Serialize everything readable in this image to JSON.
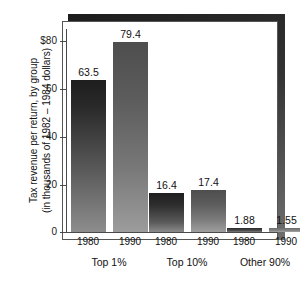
{
  "chart_data": {
    "type": "bar",
    "title": "",
    "xlabel": "",
    "ylabel_lines": [
      "Tax revenue per return, by group",
      "(in thousands of 1982 – 1984 dollars)"
    ],
    "ylim": [
      0,
      85
    ],
    "grid": false,
    "legend": "none",
    "ytick_labels": [
      "$80",
      "60",
      "40",
      "20",
      "0"
    ],
    "ytick_values": [
      80,
      60,
      40,
      20,
      0
    ],
    "categories": [
      "1980",
      "1990",
      "1980",
      "1990",
      "1980",
      "1990"
    ],
    "values": [
      63.5,
      79.4,
      16.4,
      17.4,
      1.88,
      1.55
    ],
    "value_labels": [
      "63.5",
      "79.4",
      "16.4",
      "17.4",
      "1.88",
      "1.55"
    ],
    "groups": [
      {
        "label": "Top 1%",
        "years": [
          "1980",
          "1990"
        ],
        "values": [
          63.5,
          79.4
        ]
      },
      {
        "label": "Top 10%",
        "years": [
          "1980",
          "1990"
        ],
        "values": [
          16.4,
          17.4
        ]
      },
      {
        "label": "Other 90%",
        "years": [
          "1980",
          "1990"
        ],
        "values": [
          1.88,
          1.55
        ]
      }
    ],
    "colors": {
      "bar_dark": "#2b2b2b",
      "bar_mid": "#6b6b6b",
      "bar_light": "#9a9a9a",
      "frame": "#262626",
      "panel": "#ffffff",
      "axis": "#4a4a4a",
      "text": "#111111"
    }
  }
}
